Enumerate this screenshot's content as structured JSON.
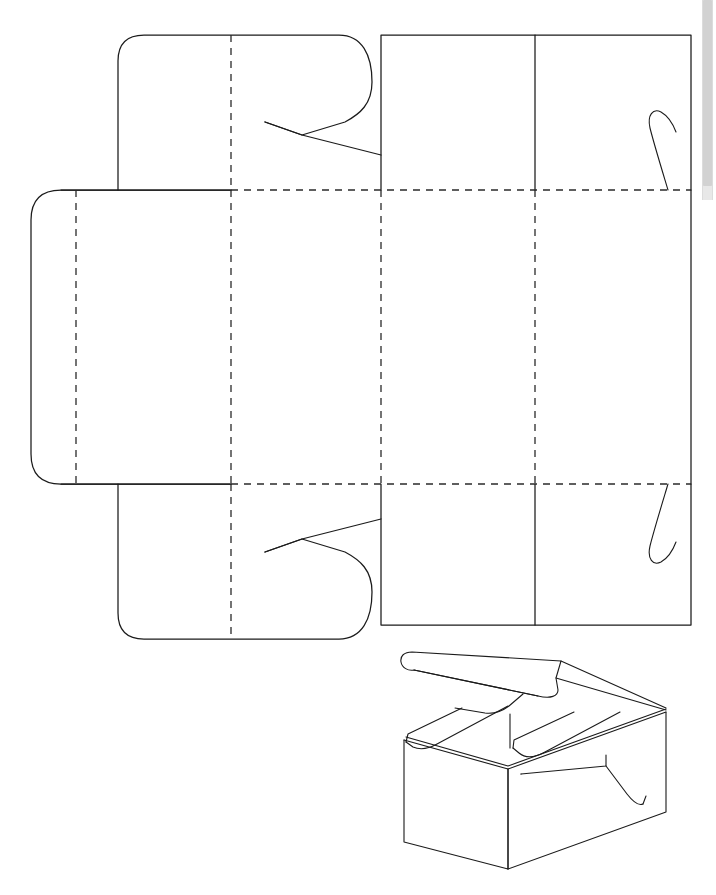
{
  "document": {
    "title": "Folding Box Dieline Template",
    "background_color": "#ffffff",
    "line_color": "#1b1b1b",
    "fold_line_color": "#2a2a2a",
    "canvas": {
      "width": 716,
      "height": 895
    }
  },
  "scrollbar": {
    "name": "vertical-scrollbar",
    "track_color": "#e8e8e8",
    "thumb_color": "#d2d2d2",
    "position": "right"
  },
  "dieline": {
    "label": "Flat box dieline layout",
    "geometry": {
      "body_left": 231,
      "body_right": 691,
      "body_top": 190,
      "body_bottom": 484,
      "fold_x": [
        231,
        381,
        535
      ],
      "fold_y": [
        190,
        484
      ],
      "left_flap": {
        "x": 31,
        "y": 190,
        "width": 200,
        "height": 294,
        "corner_radius": 30,
        "fold_x": 76
      },
      "top_flap": {
        "x": 118,
        "y": 35,
        "width": 245,
        "height": 155,
        "corner_radius": 26,
        "fold_x": 231
      },
      "bottom_flap": {
        "x": 118,
        "y": 484,
        "width": 245,
        "height": 155,
        "corner_radius": 26,
        "fold_x": 231
      },
      "top_panel": {
        "x": 381,
        "y": 35,
        "width": 310,
        "height": 155,
        "divider_x": 535
      },
      "bottom_panel": {
        "x": 381,
        "y": 484,
        "width": 310,
        "height": 141,
        "divider_x": 535
      }
    },
    "features": [
      {
        "name": "top-locking-notch",
        "type": "v-notch"
      },
      {
        "name": "bottom-locking-notch",
        "type": "v-notch"
      },
      {
        "name": "top-hook-slit",
        "type": "curved-slit"
      },
      {
        "name": "bottom-hook-slit",
        "type": "curved-slit"
      }
    ]
  },
  "assembled_view": {
    "label": "Assembled box perspective view",
    "bounds": {
      "x": 385,
      "y": 640,
      "width": 300,
      "height": 225
    },
    "parts": [
      "lid",
      "front-panel",
      "right-side-panel",
      "top-flaps",
      "side-tab"
    ]
  }
}
